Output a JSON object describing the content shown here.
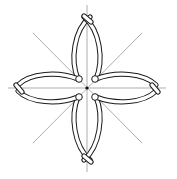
{
  "figure": {
    "width": 177,
    "height": 179,
    "center": [
      87,
      88
    ],
    "colors": {
      "background": "#ffffff",
      "cord_outline": "#1a1a1a",
      "cord_fill": "#ffffff",
      "guide_lines": "#8a8a8a",
      "center_dot": "#111111"
    },
    "guide_lines": [
      {
        "name": "vertical",
        "from": [
          87,
          5
        ],
        "to": [
          87,
          172
        ]
      },
      {
        "name": "horizontal",
        "from": [
          8,
          88
        ],
        "to": [
          166,
          88
        ]
      },
      {
        "name": "diagonal-down",
        "from": [
          33,
          33
        ],
        "to": [
          142,
          143
        ]
      },
      {
        "name": "diagonal-up",
        "from": [
          142,
          33
        ],
        "to": [
          33,
          143
        ]
      }
    ],
    "petals": [
      {
        "name": "top",
        "tip": [
          87,
          17
        ]
      },
      {
        "name": "bottom",
        "tip": [
          87,
          160
        ]
      },
      {
        "name": "left",
        "tip": [
          18,
          88
        ]
      },
      {
        "name": "right",
        "tip": [
          156,
          88
        ]
      }
    ]
  }
}
